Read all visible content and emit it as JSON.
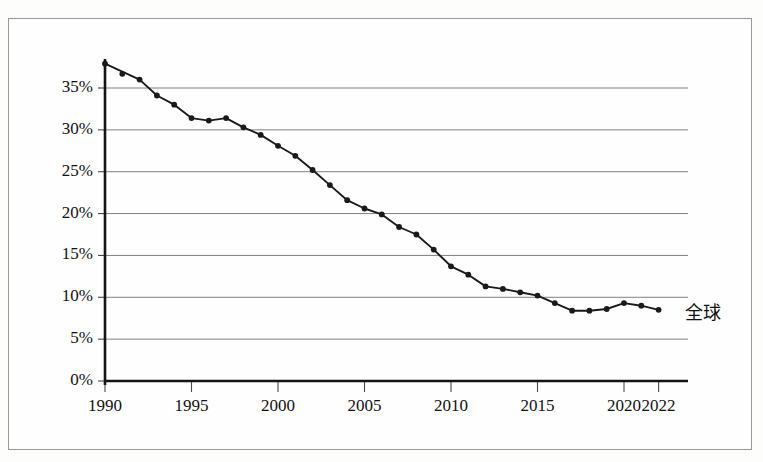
{
  "figure": {
    "background_color": "#fdfdfc",
    "frame_color": "#9a9a9a",
    "series_color": "#1a1a1a",
    "gridline_color": "#808080"
  },
  "chart_data": {
    "type": "line",
    "title": "",
    "subtitle": "",
    "xlabel": "",
    "ylabel": "",
    "grid": true,
    "grid_axis": "y",
    "legend_position": "line-end-right",
    "xlim": [
      1990,
      2023.6
    ],
    "ylim": [
      0,
      40
    ],
    "xticks": [
      1990,
      1995,
      2000,
      2005,
      2010,
      2015,
      2020,
      2022
    ],
    "xtick_labels": [
      "1990",
      "1995",
      "2000",
      "2005",
      "2010",
      "2015",
      "2020",
      "2022"
    ],
    "yticks": [
      0,
      5,
      10,
      15,
      20,
      25,
      30,
      35
    ],
    "ytick_labels": [
      "0%",
      "5%",
      "10%",
      "15%",
      "20%",
      "25%",
      "30%",
      "35%"
    ],
    "series": [
      {
        "name": "全球",
        "marker": "circle",
        "x": [
          1990,
          1991,
          1992,
          1993,
          1994,
          1995,
          1996,
          1997,
          1998,
          1999,
          2000,
          2001,
          2002,
          2003,
          2004,
          2005,
          2006,
          2007,
          2008,
          2009,
          2010,
          2011,
          2012,
          2013,
          2014,
          2015,
          2016,
          2017,
          2018,
          2019,
          2020,
          2021,
          2022
        ],
        "values": [
          37.9,
          36.7,
          36.0,
          34.1,
          33.0,
          31.4,
          31.1,
          31.4,
          30.3,
          29.4,
          28.1,
          26.9,
          25.2,
          23.4,
          21.6,
          20.6,
          19.9,
          18.4,
          17.5,
          15.7,
          13.7,
          12.7,
          11.3,
          11.0,
          10.6,
          10.2,
          9.3,
          8.4,
          8.4,
          8.6,
          9.3,
          9.0,
          8.5
        ]
      }
    ],
    "annotations": [
      {
        "text": "全球",
        "x": 2023.2,
        "y": 8.5
      }
    ]
  }
}
